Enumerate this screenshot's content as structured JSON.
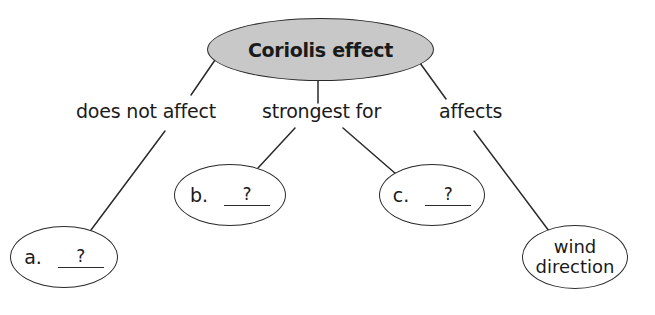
{
  "diagram": {
    "type": "concept-map",
    "root": {
      "label": "Coriolis effect",
      "fill_color": "#c8c8c8"
    },
    "links": [
      {
        "id": "does-not-affect",
        "label": "does not affect"
      },
      {
        "id": "strongest-for",
        "label": "strongest for"
      },
      {
        "id": "affects",
        "label": "affects"
      }
    ],
    "nodes": [
      {
        "id": "a",
        "letter": "a.",
        "blank": "?",
        "link": "does-not-affect"
      },
      {
        "id": "b",
        "letter": "b.",
        "blank": "?",
        "link": "strongest-for"
      },
      {
        "id": "c",
        "letter": "c.",
        "blank": "?",
        "link": "strongest-for"
      },
      {
        "id": "wind-direction",
        "line1": "wind",
        "line2": "direction",
        "link": "affects"
      }
    ],
    "edges": [
      [
        "Coriolis effect",
        "does not affect"
      ],
      [
        "does not affect",
        "a"
      ],
      [
        "Coriolis effect",
        "strongest for"
      ],
      [
        "strongest for",
        "b"
      ],
      [
        "strongest for",
        "c"
      ],
      [
        "Coriolis effect",
        "affects"
      ],
      [
        "affects",
        "wind direction"
      ]
    ]
  }
}
